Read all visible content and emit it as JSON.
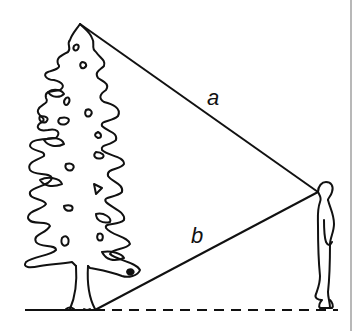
{
  "diagram": {
    "labels": {
      "a": "a",
      "b": "b"
    },
    "points": {
      "tree_top": [
        80,
        24
      ],
      "eye": [
        318,
        192
      ],
      "tree_base": [
        95,
        310
      ]
    },
    "ground_y": 310,
    "colors": {
      "stroke": "#111111",
      "border": "#b0b0b0"
    }
  }
}
